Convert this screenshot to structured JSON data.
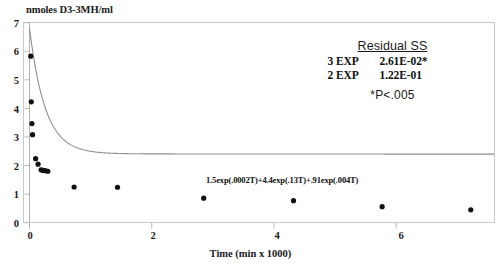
{
  "chart_data": {
    "type": "scatter",
    "title": "",
    "ylabel": "nmoles D3-3MH/ml",
    "xlabel": "Time (min x 1000)",
    "xlim": [
      0,
      7.6
    ],
    "ylim": [
      0,
      7
    ],
    "x_ticks": [
      "0",
      "2",
      "4",
      "6"
    ],
    "x_tick_values": [
      0,
      2,
      4,
      6
    ],
    "y_ticks": [
      "0",
      "1",
      "2",
      "3",
      "4",
      "5",
      "6",
      "7"
    ],
    "y_tick_values": [
      0,
      1,
      2,
      3,
      4,
      5,
      6,
      7
    ],
    "grid": false,
    "legend_position": "top-right",
    "marker": "filled-circle",
    "marker_color": "#111111",
    "fit_line_color": "#8a8a8a",
    "series": [
      {
        "name": "D3-3MH plasma concentration",
        "x": [
          0.02,
          0.03,
          0.04,
          0.05,
          0.1,
          0.14,
          0.19,
          0.22,
          0.26,
          0.3,
          0.73,
          1.44,
          2.85,
          4.32,
          5.77,
          7.22
        ],
        "y": [
          5.83,
          4.23,
          3.47,
          3.08,
          2.24,
          2.05,
          1.85,
          1.83,
          1.82,
          1.8,
          1.25,
          1.24,
          0.86,
          0.77,
          0.56,
          0.45
        ]
      }
    ],
    "fit_curve": {
      "name": "3-exponential fit",
      "equation": "1.5exp(.0002T)+4.4exp(.13T)+.91exp(.004T)",
      "terms": [
        {
          "coefficient": 1.5,
          "rate": 0.0002
        },
        {
          "coefficient": 4.4,
          "rate": 0.13
        },
        {
          "coefficient": 0.91,
          "rate": 0.004
        }
      ]
    },
    "annotations": {
      "equation_text": "1.5exp(.0002T)+4.4exp(.13T)+.91exp(.004T)",
      "residual_heading": "Residual SS",
      "residual_rows": [
        {
          "model": "3 EXP",
          "value": "2.61E-02*"
        },
        {
          "model": "2 EXP",
          "value": "1.22E-01"
        }
      ],
      "significance_note": "*P<.005"
    }
  }
}
